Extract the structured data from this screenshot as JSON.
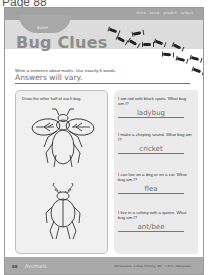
{
  "page_label": "Page 88",
  "header": {
    "tagline": "think · know · predict · reflect",
    "pill_label": "Solve",
    "title": "Bug Clues"
  },
  "prompt": {
    "instruction": "Write a sentence about maths. Use exactly 6 words.",
    "answer": "Answers will vary."
  },
  "drawing_panel": {
    "instruction": "Draw the other half of each bug.",
    "bugs": [
      "fly-half-drawing",
      "beetle-half-drawing"
    ]
  },
  "clues": [
    {
      "question": "I am red with black spots. What bug am I?",
      "answer": "ladybug"
    },
    {
      "question": "I make a chirping sound. What bug am I?",
      "answer": "cricket"
    },
    {
      "question": "I can live on a dog or on a cat. What bug am I?",
      "answer": "flea"
    },
    {
      "question": "I live in a colony with a queen. What bug am I?",
      "answer": "ant/bee"
    }
  ],
  "footer": {
    "page_number": "88",
    "section": "Animals",
    "credit": "Skill Boosters · Critical Thinking · RIC · © R.I.C. Publications"
  }
}
